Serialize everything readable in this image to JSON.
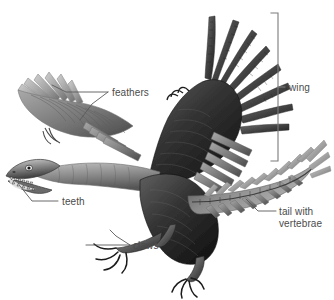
{
  "figure": {
    "style": "grayscale scientific illustration with callout labels",
    "background_color": "#ffffff",
    "label_color": "#4b4b4b",
    "leader_line_color": "#5a5a5a",
    "bracket_color": "#7b7b7b"
  },
  "labels": {
    "feathers": "feathers",
    "wing": "wing",
    "teeth": "teeth",
    "claws": "claws",
    "tail_line1": "tail with",
    "tail_line2": "vertebrae"
  },
  "annotations": [
    {
      "name": "feathers",
      "text": "feathers",
      "x": 110,
      "y": 96,
      "anchor": "start",
      "leaders": 2
    },
    {
      "name": "wing",
      "text": "wing",
      "x": 290,
      "y": 92,
      "anchor": "start",
      "leaders": 1,
      "bracket": true
    },
    {
      "name": "teeth",
      "text": "teeth",
      "x": 62,
      "y": 205,
      "anchor": "start",
      "leaders": 1
    },
    {
      "name": "claws",
      "text": "claws",
      "x": 133,
      "y": 249,
      "anchor": "start",
      "leaders": 2
    },
    {
      "name": "tail-with-vertebrae",
      "text": "tail with vertebrae",
      "x": 279,
      "y": 212,
      "anchor": "start",
      "leaders": 1
    }
  ],
  "bracket": {
    "name": "wing-bracket",
    "x": 278,
    "top": 13,
    "bottom": 161,
    "tick_length": 7
  },
  "anatomy_parts": [
    "head with toothed jaws",
    "far wing with feathers",
    "near wing raised with primary feathers",
    "wing claws",
    "feathered body",
    "long bony tail with feathers",
    "clawed hind feet"
  ]
}
